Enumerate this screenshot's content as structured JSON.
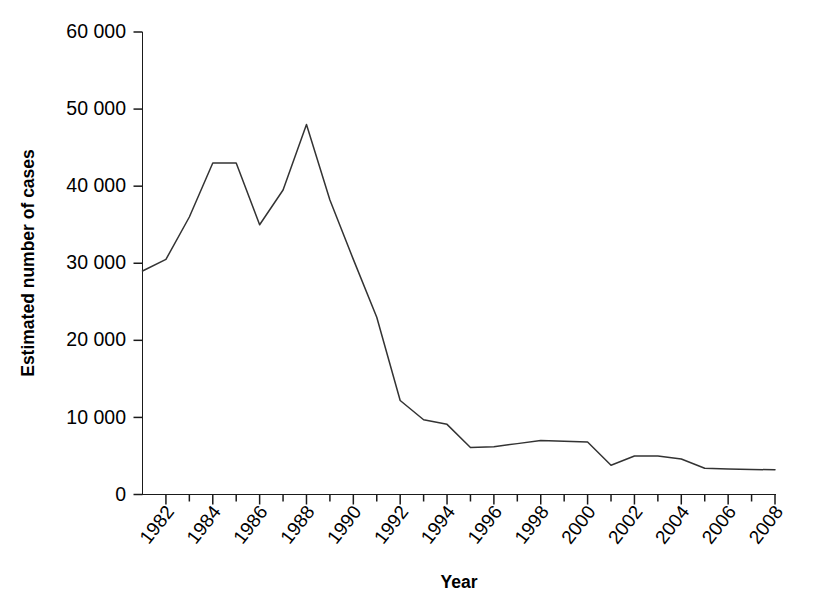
{
  "chart_data": {
    "type": "line",
    "title": "",
    "xlabel": "Year",
    "ylabel": "Estimated number of cases",
    "xlim": [
      1981,
      2008
    ],
    "ylim": [
      0,
      60000
    ],
    "grid": false,
    "legend": null,
    "y_tick_labels": [
      "60 000",
      "50 000",
      "40 000",
      "30 000",
      "20 000",
      "10 000",
      "0"
    ],
    "y_tick_values": [
      60000,
      50000,
      40000,
      30000,
      20000,
      10000,
      0
    ],
    "x_tick_labels": [
      "1982",
      "1984",
      "1986",
      "1988",
      "1990",
      "1992",
      "1994",
      "1996",
      "1998",
      "2000",
      "2002",
      "2004",
      "2006",
      "2008"
    ],
    "x_tick_values": [
      1982,
      1984,
      1986,
      1988,
      1990,
      1992,
      1994,
      1996,
      1998,
      2000,
      2002,
      2004,
      2006,
      2008
    ],
    "x_minor_tick_values": [
      1983,
      1985,
      1987,
      1989,
      1991,
      1993,
      1995,
      1997,
      1999,
      2001,
      2003,
      2005,
      2007
    ],
    "series": [
      {
        "name": "Estimated number of cases",
        "color": "#333333",
        "x": [
          1981,
          1982,
          1983,
          1984,
          1985,
          1986,
          1987,
          1988,
          1989,
          1990,
          1991,
          1992,
          1993,
          1994,
          1995,
          1996,
          1997,
          1998,
          1999,
          2000,
          2001,
          2002,
          2003,
          2004,
          2005,
          2006,
          2007,
          2008
        ],
        "values": [
          29000,
          30500,
          36000,
          43000,
          43000,
          35000,
          39500,
          48000,
          38200,
          30500,
          23000,
          12200,
          9700,
          9100,
          6100,
          6200,
          6600,
          7000,
          6900,
          6800,
          3800,
          5000,
          5000,
          4600,
          3400,
          3300,
          3250,
          3200
        ]
      }
    ]
  },
  "axis_titles": {
    "x": "Year",
    "y": "Estimated number of cases"
  }
}
